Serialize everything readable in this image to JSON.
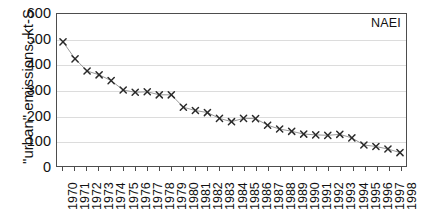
{
  "figure": {
    "annotation": "NAEI",
    "scan_artifact_top": "",
    "scan_artifact_right": ""
  },
  "chart_data": {
    "type": "line",
    "title": "",
    "subtitle": "",
    "xlabel": "",
    "ylabel": "\"urban\" emissions, kt-S",
    "xlim": [
      1969.5,
      1998.5
    ],
    "ylim": [
      0,
      600
    ],
    "yticks": [
      0,
      100,
      200,
      300,
      400,
      500,
      600
    ],
    "ytick_labels": [
      "0",
      "100",
      "200",
      "300",
      "400",
      "500",
      "600"
    ],
    "grid": "horizontal",
    "legend": "none",
    "annotations": [
      {
        "text": "NAEI",
        "position": "top-right-inside"
      }
    ],
    "marker": "x",
    "marker_color": "#2a2a2a",
    "line_color": "#8c8c8c",
    "categories": [
      "1970",
      "1971",
      "1972",
      "1973",
      "1974",
      "1975",
      "1976",
      "1977",
      "1978",
      "1979",
      "1980",
      "1981",
      "1982",
      "1983",
      "1984",
      "1985",
      "1986",
      "1987",
      "1988",
      "1989",
      "1990",
      "1991",
      "1992",
      "1993",
      "1994",
      "1995",
      "1996",
      "1997",
      "1998"
    ],
    "x": [
      1970,
      1971,
      1972,
      1973,
      1974,
      1975,
      1976,
      1977,
      1978,
      1979,
      1980,
      1981,
      1982,
      1983,
      1984,
      1985,
      1986,
      1987,
      1988,
      1989,
      1990,
      1991,
      1992,
      1993,
      1994,
      1995,
      1996,
      1997,
      1998
    ],
    "series": [
      {
        "name": "\"urban\" emissions",
        "values": [
          490,
          423,
          375,
          360,
          337,
          300,
          291,
          293,
          281,
          281,
          232,
          219,
          211,
          188,
          175,
          188,
          187,
          161,
          146,
          137,
          126,
          123,
          121,
          125,
          111,
          83,
          77,
          67,
          53
        ]
      }
    ]
  }
}
